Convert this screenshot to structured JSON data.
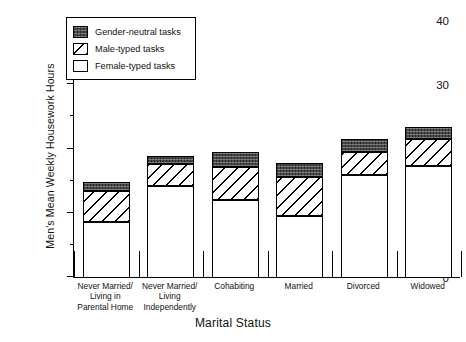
{
  "chart_data": {
    "type": "bar",
    "subtype": "stacked-bar",
    "title": "",
    "xlabel": "Marital Status",
    "ylabel": "Men's Mean Weekly Housework Hours",
    "ylim": [
      0,
      40
    ],
    "ytick_major": [
      0,
      10,
      20,
      30,
      40
    ],
    "ytick_minor": [
      5,
      15,
      25,
      35
    ],
    "ytick_labels": [
      "0",
      "10",
      "20",
      "30",
      "40"
    ],
    "grid": false,
    "legend_position": "top-left",
    "categories": [
      "Never Married/\nLiving in\nParental Home",
      "Never Married/\nLiving\nIndependently",
      "Cohabiting",
      "Married",
      "Divorced",
      "Widowed"
    ],
    "series": [
      {
        "name": "Female-typed tasks",
        "values": [
          8.6,
          14.2,
          12.0,
          9.5,
          15.9,
          17.3
        ]
      },
      {
        "name": "Male-typed tasks",
        "values": [
          4.8,
          3.4,
          5.1,
          6.1,
          3.6,
          4.2
        ]
      },
      {
        "name": "Gender-neutral tasks",
        "values": [
          1.4,
          1.2,
          2.4,
          2.1,
          2.0,
          1.8
        ]
      }
    ],
    "totals": [
      14.8,
      18.8,
      19.5,
      17.7,
      21.5,
      23.3
    ],
    "colors": {
      "female": "#ffffff",
      "male": "#ffffff",
      "neutral": "#4a4a4a",
      "outline": "#000000",
      "background": "#ffffff"
    }
  },
  "legend": {
    "items": [
      {
        "label": "Gender-neutral tasks",
        "pattern": "solid-dark"
      },
      {
        "label": "Male-typed tasks",
        "pattern": "diagonal-hatch"
      },
      {
        "label": "Female-typed tasks",
        "pattern": "blank-white"
      }
    ]
  }
}
